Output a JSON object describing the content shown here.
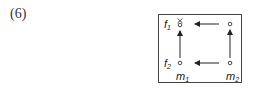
{
  "example_number": "(6)",
  "diagram": {
    "row_labels": [
      {
        "name": "f",
        "sub": "1"
      },
      {
        "name": "f",
        "sub": "2"
      }
    ],
    "column_labels": [
      {
        "name": "m",
        "sub": "1"
      },
      {
        "name": "m",
        "sub": "2"
      }
    ],
    "nodes": [
      {
        "id": "f1m1",
        "row": "f1",
        "col": "m1",
        "marker": "selected"
      },
      {
        "id": "f1m2",
        "row": "f1",
        "col": "m2",
        "marker": "circle"
      },
      {
        "id": "f2m1",
        "row": "f2",
        "col": "m1",
        "marker": "circle"
      },
      {
        "id": "f2m2",
        "row": "f2",
        "col": "m2",
        "marker": "circle"
      }
    ],
    "arrows": [
      {
        "from": "f1m2",
        "to": "f1m1",
        "direction": "left"
      },
      {
        "from": "f2m2",
        "to": "f2m1",
        "direction": "left"
      },
      {
        "from": "f2m1",
        "to": "f1m1",
        "direction": "up"
      },
      {
        "from": "f2m2",
        "to": "f1m2",
        "direction": "up"
      }
    ],
    "colors": {
      "line": "#222222",
      "frame": "#444444"
    }
  }
}
